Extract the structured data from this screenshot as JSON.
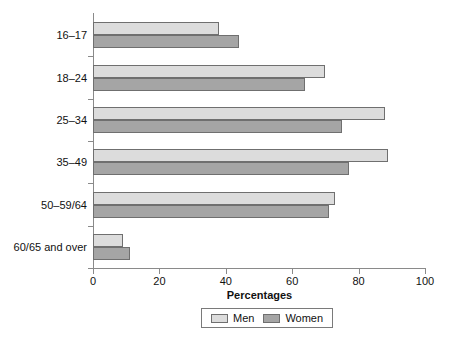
{
  "chart_data": {
    "type": "bar",
    "orientation": "horizontal",
    "title": "",
    "xlabel": "Percentages",
    "ylabel": "",
    "xlim": [
      0,
      100
    ],
    "grid": false,
    "legend_position": "bottom",
    "categories": [
      "16–17",
      "18–24",
      "25–34",
      "35–49",
      "50–59/64",
      "60/65 and over"
    ],
    "xticks": [
      0,
      20,
      40,
      60,
      80,
      100
    ],
    "xtick_labels": [
      "0",
      "20",
      "40",
      "60",
      "80",
      "100"
    ],
    "series": [
      {
        "name": "Men",
        "color": "#dcdcdc",
        "values": [
          38,
          70,
          88,
          89,
          73,
          9
        ]
      },
      {
        "name": "Women",
        "color": "#a5a5a5",
        "values": [
          44,
          64,
          75,
          77,
          71,
          11
        ]
      }
    ]
  },
  "legend": {
    "items": [
      {
        "label": "Men"
      },
      {
        "label": "Women"
      }
    ]
  },
  "colors": {
    "men": "#dcdcdc",
    "women": "#a5a5a5",
    "axis": "#8a8a8a",
    "bar_border": "#6f6f6f",
    "text": "#111111",
    "background": "#ffffff"
  }
}
